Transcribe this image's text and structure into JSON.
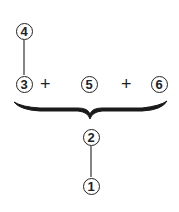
{
  "nodes": {
    "n1": {
      "label": "1"
    },
    "n2": {
      "label": "2"
    },
    "n3": {
      "label": "3"
    },
    "n4": {
      "label": "4"
    },
    "n5": {
      "label": "5"
    },
    "n6": {
      "label": "6"
    }
  },
  "operators": {
    "op1": "+",
    "op2": "+"
  },
  "colors": {
    "stroke": "#222222",
    "background": "#ffffff"
  }
}
